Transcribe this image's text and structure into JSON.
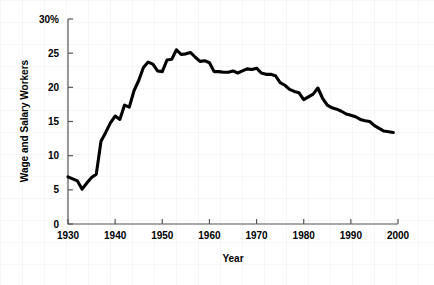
{
  "chart_data": {
    "type": "line",
    "title": "",
    "xlabel": "Year",
    "ylabel": "Wage and Salary Workers",
    "xlim": [
      1930,
      2000
    ],
    "ylim": [
      0,
      30
    ],
    "grid": true,
    "legend": null,
    "x_ticks": [
      "1930",
      "1940",
      "1950",
      "1960",
      "1970",
      "1980",
      "1990",
      "2000"
    ],
    "y_ticks": [
      "0",
      "5",
      "10",
      "15",
      "20",
      "25",
      "30%"
    ],
    "x_tick_values": [
      1930,
      1940,
      1950,
      1960,
      1970,
      1980,
      1990,
      2000
    ],
    "y_tick_values": [
      0,
      5,
      10,
      15,
      20,
      25,
      30
    ],
    "line_color": "#000000",
    "axis_color": "#555555",
    "background_color": "#ffffff",
    "series": [
      {
        "name": "Wage and Salary Workers",
        "x": [
          1930,
          1931,
          1932,
          1933,
          1934,
          1935,
          1936,
          1937,
          1938,
          1939,
          1940,
          1941,
          1942,
          1943,
          1944,
          1945,
          1946,
          1947,
          1948,
          1949,
          1950,
          1951,
          1952,
          1953,
          1954,
          1955,
          1956,
          1957,
          1958,
          1959,
          1960,
          1961,
          1962,
          1963,
          1964,
          1965,
          1966,
          1967,
          1968,
          1969,
          1970,
          1971,
          1972,
          1973,
          1974,
          1975,
          1976,
          1977,
          1978,
          1979,
          1980,
          1981,
          1982,
          1983,
          1984,
          1985,
          1986,
          1987,
          1988,
          1989,
          1990,
          1991,
          1992,
          1993,
          1994,
          1995,
          1996,
          1997,
          1998,
          1999
        ],
        "values": [
          6.9,
          6.6,
          6.3,
          5.1,
          6.0,
          6.8,
          7.3,
          12.1,
          13.4,
          14.8,
          15.8,
          15.3,
          17.4,
          17.1,
          19.5,
          21.0,
          22.9,
          23.7,
          23.4,
          22.4,
          22.3,
          24.0,
          24.1,
          25.5,
          24.8,
          24.9,
          25.1,
          24.4,
          23.8,
          23.9,
          23.6,
          22.3,
          22.3,
          22.2,
          22.2,
          22.4,
          22.1,
          22.4,
          22.7,
          22.6,
          22.8,
          22.1,
          21.9,
          21.9,
          21.7,
          20.7,
          20.3,
          19.7,
          19.4,
          19.2,
          18.2,
          18.6,
          19.0,
          19.9,
          18.4,
          17.4,
          17.0,
          16.8,
          16.5,
          16.1,
          15.9,
          15.7,
          15.3,
          15.1,
          15.0,
          14.4,
          14.0,
          13.6,
          13.5,
          13.4
        ]
      }
    ]
  },
  "axis": {
    "y_label": "Wage and Salary Workers",
    "x_label": "Year"
  }
}
